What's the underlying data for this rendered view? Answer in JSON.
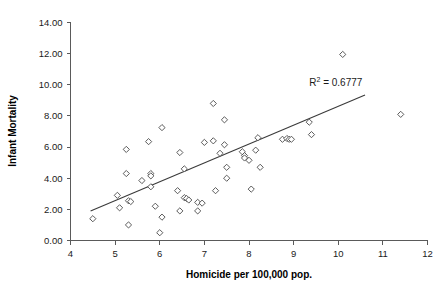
{
  "chart_data": {
    "type": "scatter",
    "title": "",
    "xlabel": "Homicide per 100,000 pop.",
    "ylabel": "Infant Mortality",
    "xlim": [
      4,
      12
    ],
    "ylim": [
      0,
      14
    ],
    "xticks": [
      "4",
      "5",
      "6",
      "7",
      "8",
      "9",
      "10",
      "11",
      "12"
    ],
    "yticks": [
      "0.00",
      "2.00",
      "4.00",
      "6.00",
      "8.00",
      "10.00",
      "12.00",
      "14.00"
    ],
    "grid": false,
    "legend": null,
    "annotations": [
      {
        "text_prefix": "R",
        "text_sup": "2",
        "text_suffix": " = 0.6777",
        "full_text": "R2 = 0.6777",
        "x": 9.35,
        "y": 9.95
      }
    ],
    "marker_style": "open-diamond",
    "trendline": {
      "type": "linear",
      "r_squared": 0.6777,
      "x_start": 4.45,
      "y_start": 1.9,
      "x_end": 10.6,
      "y_end": 9.35
    },
    "points": [
      [
        4.5,
        1.4
      ],
      [
        5.05,
        2.9
      ],
      [
        5.1,
        2.1
      ],
      [
        5.25,
        5.85
      ],
      [
        5.25,
        4.3
      ],
      [
        5.3,
        2.55
      ],
      [
        5.35,
        2.5
      ],
      [
        5.3,
        1.0
      ],
      [
        5.6,
        3.85
      ],
      [
        5.75,
        6.35
      ],
      [
        5.8,
        4.3
      ],
      [
        5.8,
        4.15
      ],
      [
        5.8,
        3.45
      ],
      [
        5.9,
        2.2
      ],
      [
        6.0,
        0.5
      ],
      [
        6.05,
        7.25
      ],
      [
        6.05,
        1.5
      ],
      [
        6.4,
        3.2
      ],
      [
        6.45,
        5.65
      ],
      [
        6.45,
        1.9
      ],
      [
        6.55,
        4.6
      ],
      [
        6.55,
        2.75
      ],
      [
        6.6,
        2.7
      ],
      [
        6.65,
        2.6
      ],
      [
        6.85,
        2.45
      ],
      [
        6.85,
        1.9
      ],
      [
        6.95,
        2.4
      ],
      [
        7.0,
        6.3
      ],
      [
        7.2,
        8.8
      ],
      [
        7.2,
        6.4
      ],
      [
        7.25,
        3.2
      ],
      [
        7.35,
        5.6
      ],
      [
        7.45,
        7.75
      ],
      [
        7.45,
        6.15
      ],
      [
        7.5,
        4.7
      ],
      [
        7.5,
        4.0
      ],
      [
        7.85,
        5.7
      ],
      [
        7.9,
        5.45
      ],
      [
        7.9,
        5.3
      ],
      [
        8.0,
        5.15
      ],
      [
        8.05,
        3.3
      ],
      [
        8.15,
        5.8
      ],
      [
        8.2,
        6.6
      ],
      [
        8.25,
        4.7
      ],
      [
        8.75,
        6.5
      ],
      [
        8.85,
        6.55
      ],
      [
        8.9,
        6.5
      ],
      [
        8.95,
        6.5
      ],
      [
        9.35,
        7.6
      ],
      [
        9.4,
        6.8
      ],
      [
        10.1,
        11.95
      ],
      [
        11.4,
        8.1
      ]
    ]
  },
  "labels": {
    "y_axis_title": "Infant Mortality",
    "x_axis_title": "Homicide per 100,000 pop."
  }
}
